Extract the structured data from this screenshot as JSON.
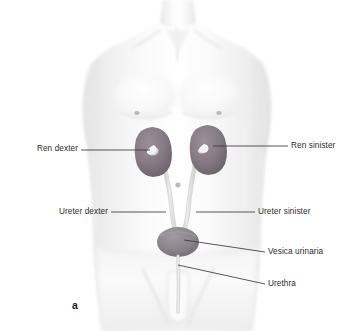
{
  "figure": {
    "caption": "a",
    "type": "anatomical-illustration",
    "background_color": "#ffffff",
    "body_color": "#f2f2f2",
    "body_shade_color": "#e3e3e3",
    "organ_color": "#8c8086",
    "organ_dark_color": "#6f6670",
    "tube_color": "#dcdcdc",
    "leader_color": "#3a3a3a",
    "text_color": "#2b2b2b"
  },
  "labels": [
    {
      "id": "ren-dexter",
      "text": "Ren dexter",
      "side": "left",
      "text_right": 78,
      "text_top": 144,
      "leader": {
        "x1": 81,
        "y1": 150,
        "x2": 150,
        "y2": 150
      }
    },
    {
      "id": "ren-sinister",
      "text": "Ren sinister",
      "side": "right",
      "text_left": 291,
      "text_top": 141,
      "leader": {
        "x1": 288,
        "y1": 146,
        "x2": 213,
        "y2": 146
      }
    },
    {
      "id": "ureter-dexter",
      "text": "Ureter dexter",
      "side": "left",
      "text_right": 108,
      "text_top": 207,
      "leader": {
        "x1": 111,
        "y1": 212,
        "x2": 166,
        "y2": 212
      }
    },
    {
      "id": "ureter-sinister",
      "text": "Ureter sinister",
      "side": "right",
      "text_left": 258,
      "text_top": 207,
      "leader": {
        "x1": 255,
        "y1": 212,
        "x2": 196,
        "y2": 212
      }
    },
    {
      "id": "vesica-urinaria",
      "text": "Vesica urinaria",
      "side": "right",
      "text_left": 268,
      "text_top": 247,
      "leader": {
        "x1": 265,
        "y1": 252,
        "x2": 184,
        "y2": 240
      }
    },
    {
      "id": "urethra",
      "text": "Urethra",
      "side": "right",
      "text_left": 268,
      "text_top": 279,
      "leader": {
        "x1": 265,
        "y1": 284,
        "x2": 178,
        "y2": 265
      }
    }
  ],
  "organs": {
    "right_kidney": {
      "name": "Ren dexter",
      "cx": 152,
      "cy": 150
    },
    "left_kidney": {
      "name": "Ren sinister",
      "cx": 206,
      "cy": 148
    },
    "right_ureter": {
      "name": "Ureter dexter"
    },
    "left_ureter": {
      "name": "Ureter sinister"
    },
    "bladder": {
      "name": "Vesica urinaria",
      "cx": 178,
      "cy": 242
    },
    "urethra": {
      "name": "Urethra"
    }
  }
}
